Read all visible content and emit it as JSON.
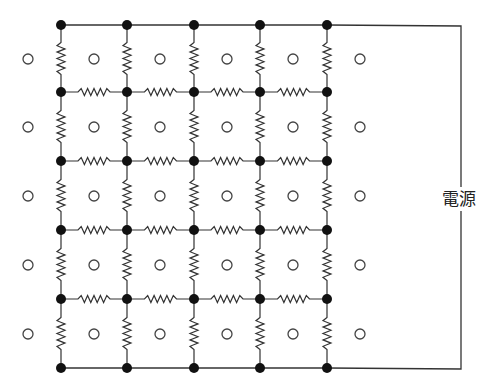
{
  "diagram": {
    "power_label": "電源",
    "colors": {
      "wire": "#333333",
      "node": "#111111",
      "circle": "#444444",
      "background": "#ffffff"
    },
    "node_columns_x": [
      61,
      127,
      194,
      260,
      327
    ],
    "node_rows_y": [
      25,
      92,
      161,
      230,
      299,
      368
    ],
    "circle_columns_x": [
      28,
      94,
      160,
      227,
      293,
      360
    ],
    "circle_rows_y": [
      59,
      127,
      196,
      265,
      334
    ],
    "circle_radius": 5,
    "node_radius": 5,
    "power_wire": {
      "right_x": 461,
      "top_y": 26,
      "bottom_y": 369,
      "label_center_y": 199
    },
    "grid": {
      "columns": 5,
      "rows": 6,
      "top_and_bottom_rows_plain_wire": true,
      "horizontal_resistors_between_columns": true,
      "vertical_resistors_between_rows": true
    }
  }
}
